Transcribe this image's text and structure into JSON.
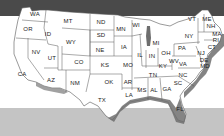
{
  "map": {
    "type": "us-states",
    "colors": {
      "top_band": "#4a4a4a",
      "land": "#ffffff",
      "borders": "#555555",
      "coastal_shading": "#6e6e6e",
      "bottom_band": "#c4c4c4"
    },
    "states": [
      {
        "abbr": "WA",
        "x": 35,
        "y": 14
      },
      {
        "abbr": "OR",
        "x": 28,
        "y": 29
      },
      {
        "abbr": "CA",
        "x": 22,
        "y": 74
      },
      {
        "abbr": "NV",
        "x": 36,
        "y": 52
      },
      {
        "abbr": "ID",
        "x": 48,
        "y": 34
      },
      {
        "abbr": "MT",
        "x": 68,
        "y": 21
      },
      {
        "abbr": "WY",
        "x": 71,
        "y": 42
      },
      {
        "abbr": "UT",
        "x": 52,
        "y": 58
      },
      {
        "abbr": "CO",
        "x": 79,
        "y": 62
      },
      {
        "abbr": "AZ",
        "x": 51,
        "y": 80
      },
      {
        "abbr": "NM",
        "x": 75,
        "y": 83
      },
      {
        "abbr": "ND",
        "x": 101,
        "y": 22
      },
      {
        "abbr": "SD",
        "x": 101,
        "y": 35
      },
      {
        "abbr": "NE",
        "x": 100,
        "y": 50
      },
      {
        "abbr": "KS",
        "x": 105,
        "y": 65
      },
      {
        "abbr": "OK",
        "x": 109,
        "y": 82
      },
      {
        "abbr": "TX",
        "x": 102,
        "y": 100
      },
      {
        "abbr": "MN",
        "x": 121,
        "y": 29
      },
      {
        "abbr": "IA",
        "x": 124,
        "y": 47
      },
      {
        "abbr": "MO",
        "x": 128,
        "y": 65
      },
      {
        "abbr": "AR",
        "x": 128,
        "y": 82
      },
      {
        "abbr": "LA",
        "x": 129,
        "y": 95
      },
      {
        "abbr": "WI",
        "x": 136,
        "y": 25
      },
      {
        "abbr": "IL",
        "x": 140,
        "y": 55
      },
      {
        "abbr": "MI",
        "x": 156,
        "y": 43
      },
      {
        "abbr": "IN",
        "x": 152,
        "y": 56
      },
      {
        "abbr": "OH",
        "x": 166,
        "y": 53
      },
      {
        "abbr": "KY",
        "x": 163,
        "y": 66
      },
      {
        "abbr": "TN",
        "x": 153,
        "y": 75
      },
      {
        "abbr": "MS",
        "x": 142,
        "y": 90
      },
      {
        "abbr": "AL",
        "x": 154,
        "y": 90
      },
      {
        "abbr": "GA",
        "x": 167,
        "y": 89
      },
      {
        "abbr": "FL",
        "x": 180,
        "y": 109
      },
      {
        "abbr": "SC",
        "x": 178,
        "y": 83
      },
      {
        "abbr": "NC",
        "x": 183,
        "y": 75
      },
      {
        "abbr": "VA",
        "x": 183,
        "y": 64
      },
      {
        "abbr": "WV",
        "x": 174,
        "y": 61
      },
      {
        "abbr": "PA",
        "x": 182,
        "y": 48
      },
      {
        "abbr": "NY",
        "x": 189,
        "y": 36
      },
      {
        "abbr": "VT",
        "x": 192,
        "y": 19
      },
      {
        "abbr": "ME",
        "x": 207,
        "y": 19
      },
      {
        "abbr": "NH",
        "x": 211,
        "y": 26
      },
      {
        "abbr": "MA",
        "x": 217,
        "y": 34
      },
      {
        "abbr": "RI",
        "x": 216,
        "y": 40
      },
      {
        "abbr": "CT",
        "x": 212,
        "y": 47
      },
      {
        "abbr": "NJ",
        "x": 201,
        "y": 53
      },
      {
        "abbr": "DE",
        "x": 204,
        "y": 60
      },
      {
        "abbr": "MD",
        "x": 205,
        "y": 66
      }
    ]
  }
}
